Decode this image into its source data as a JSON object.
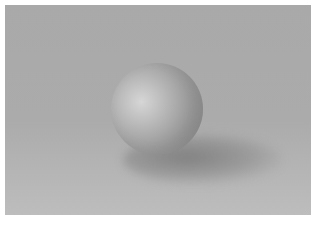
{
  "image": {
    "subject": "gray shaded sphere on a plain surface",
    "colors": {
      "border": "#ffffff",
      "background": "#a9a9a9",
      "floor": "#bdbdbd",
      "sphere_highlight": "#d6d6d6",
      "sphere_shadow": "#777777"
    }
  }
}
